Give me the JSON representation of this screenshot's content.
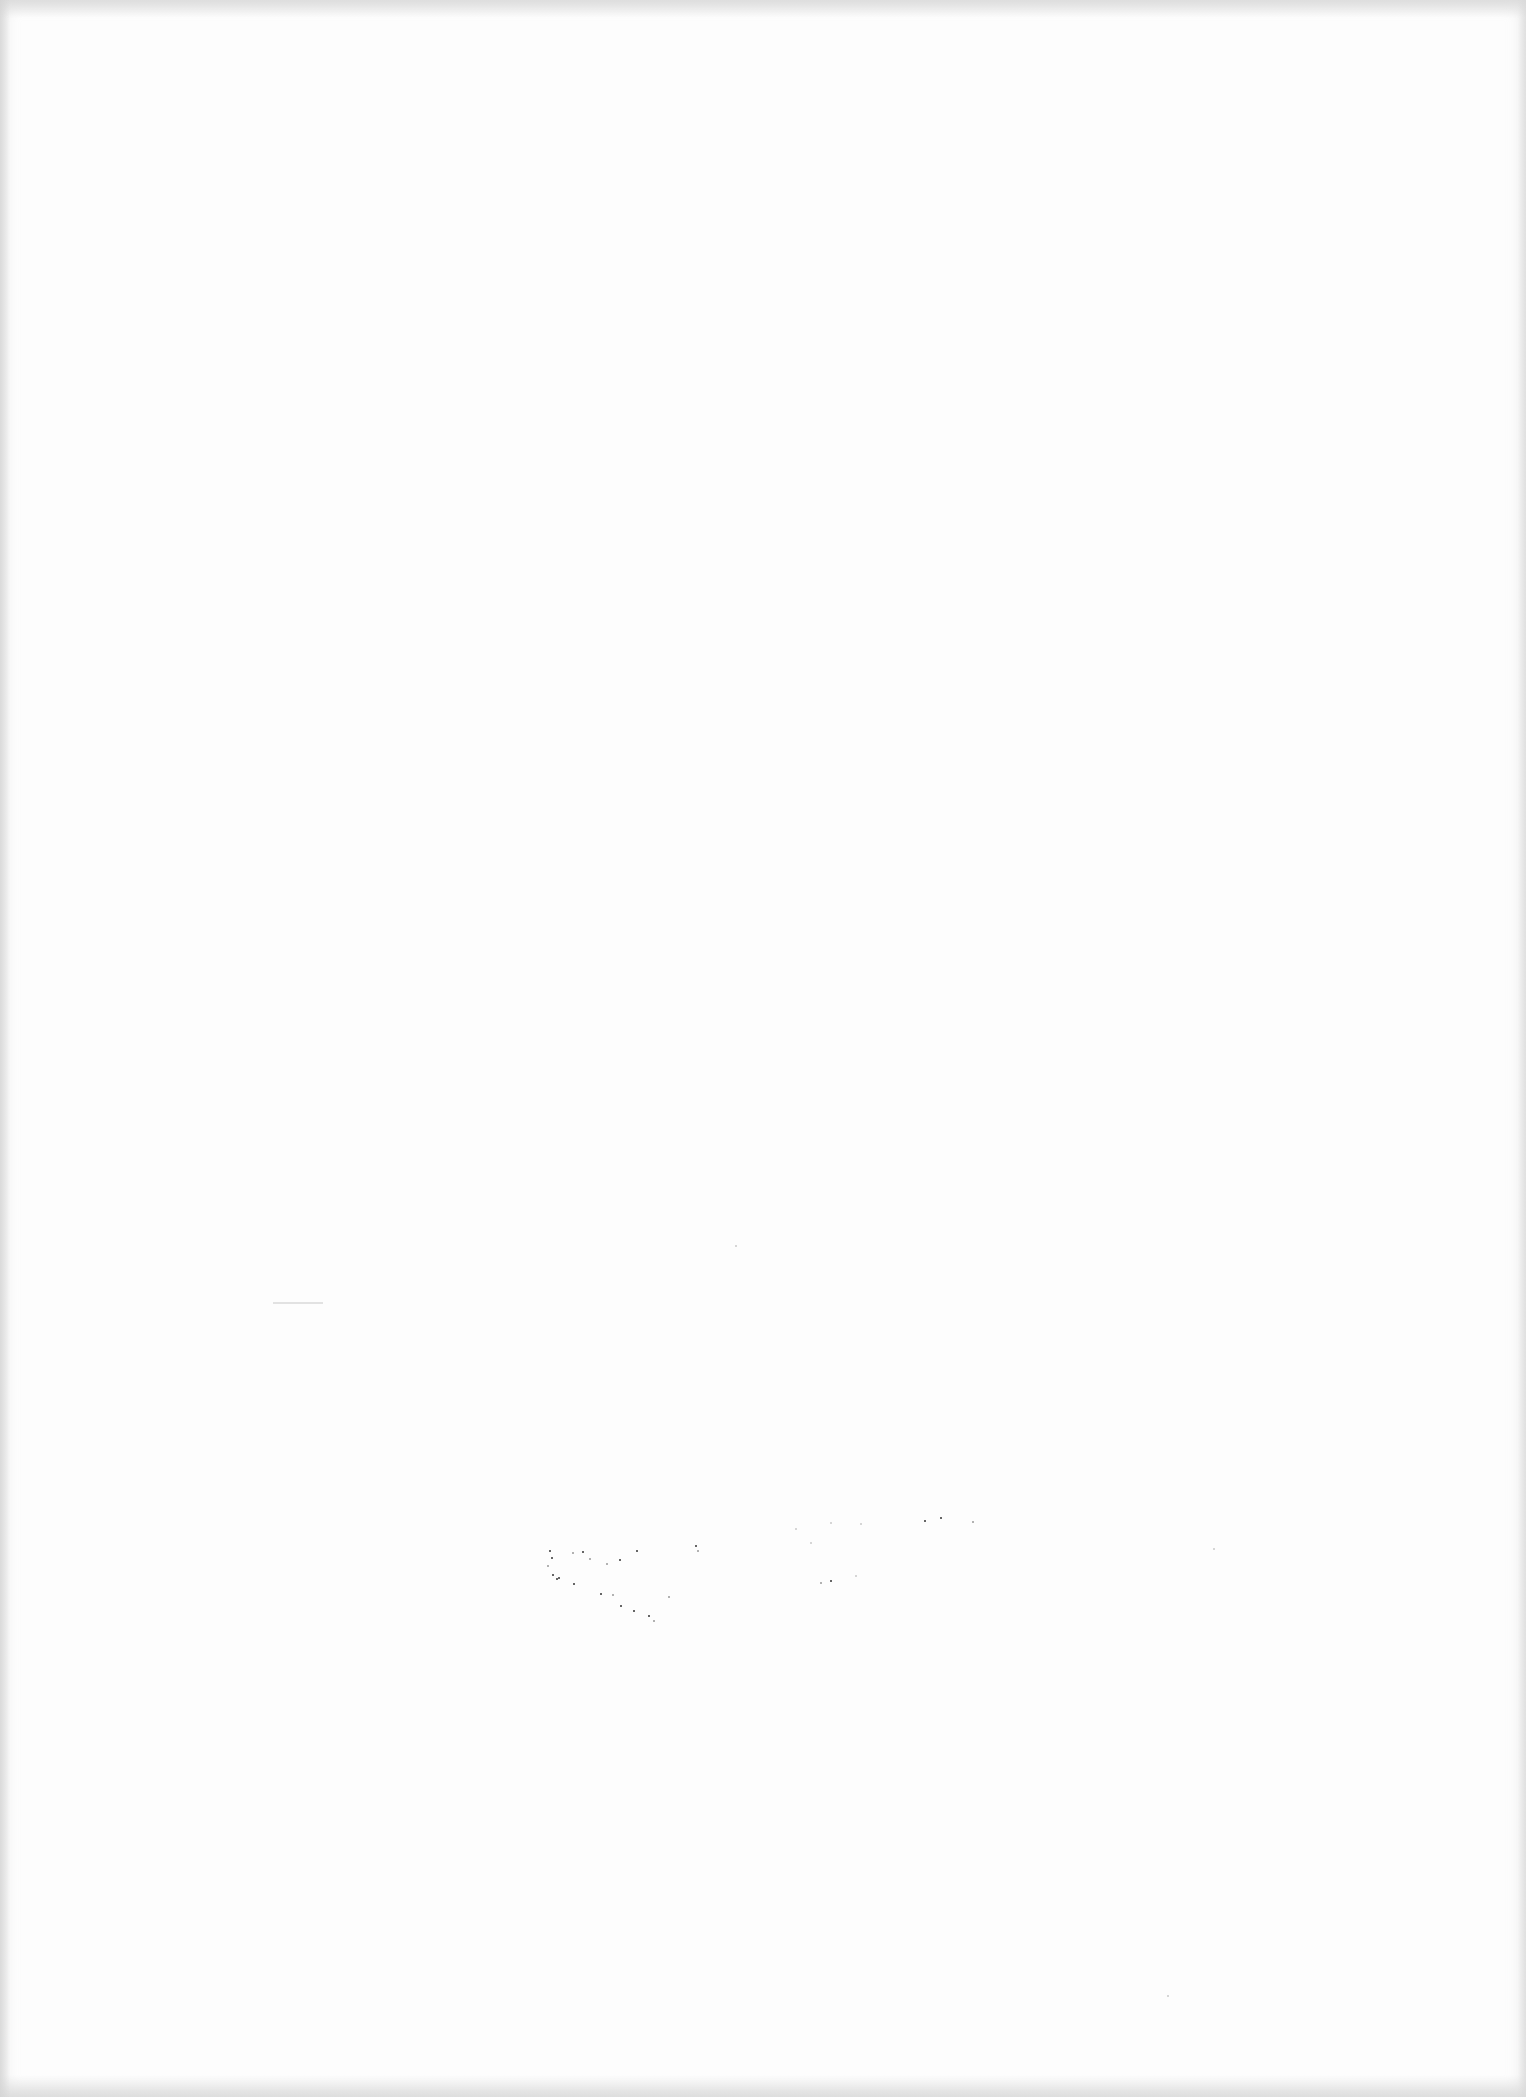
{
  "document": {
    "type": "blank scanned page",
    "text": ""
  },
  "colors": {
    "paper": "#fdfdfd",
    "scan_edge": "#d7d7d7",
    "speck": "#333333"
  },
  "specks": [
    {
      "x": 549,
      "y": 1550,
      "c": ""
    },
    {
      "x": 551,
      "y": 1557,
      "c": ""
    },
    {
      "x": 552,
      "y": 1574,
      "c": ""
    },
    {
      "x": 556,
      "y": 1578,
      "c": ""
    },
    {
      "x": 558,
      "y": 1577,
      "c": ""
    },
    {
      "x": 547,
      "y": 1565,
      "c": "light"
    },
    {
      "x": 572,
      "y": 1552,
      "c": "light"
    },
    {
      "x": 582,
      "y": 1551,
      "c": ""
    },
    {
      "x": 589,
      "y": 1558,
      "c": "light"
    },
    {
      "x": 619,
      "y": 1559,
      "c": ""
    },
    {
      "x": 606,
      "y": 1563,
      "c": "light"
    },
    {
      "x": 636,
      "y": 1550,
      "c": ""
    },
    {
      "x": 573,
      "y": 1583,
      "c": ""
    },
    {
      "x": 600,
      "y": 1593,
      "c": ""
    },
    {
      "x": 612,
      "y": 1594,
      "c": "light"
    },
    {
      "x": 620,
      "y": 1605,
      "c": ""
    },
    {
      "x": 633,
      "y": 1610,
      "c": ""
    },
    {
      "x": 648,
      "y": 1615,
      "c": ""
    },
    {
      "x": 653,
      "y": 1620,
      "c": "light"
    },
    {
      "x": 668,
      "y": 1596,
      "c": "light"
    },
    {
      "x": 695,
      "y": 1545,
      "c": ""
    },
    {
      "x": 697,
      "y": 1550,
      "c": "light"
    },
    {
      "x": 795,
      "y": 1528,
      "c": "faint"
    },
    {
      "x": 810,
      "y": 1542,
      "c": "faint"
    },
    {
      "x": 830,
      "y": 1522,
      "c": "faint"
    },
    {
      "x": 860,
      "y": 1523,
      "c": "faint"
    },
    {
      "x": 924,
      "y": 1520,
      "c": ""
    },
    {
      "x": 940,
      "y": 1517,
      "c": ""
    },
    {
      "x": 972,
      "y": 1521,
      "c": "light"
    },
    {
      "x": 820,
      "y": 1582,
      "c": "light"
    },
    {
      "x": 830,
      "y": 1580,
      "c": ""
    },
    {
      "x": 855,
      "y": 1575,
      "c": "faint"
    },
    {
      "x": 735,
      "y": 1245,
      "c": "faint"
    },
    {
      "x": 1213,
      "y": 1548,
      "c": "faint"
    },
    {
      "x": 1167,
      "y": 1995,
      "c": "faint"
    }
  ]
}
